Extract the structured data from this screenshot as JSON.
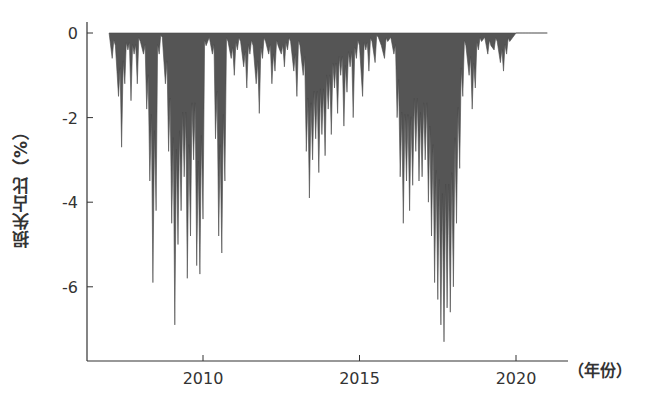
{
  "chart_data": {
    "type": "area",
    "title": "",
    "xlabel": "(年份)",
    "ylabel": "损失占比（%）",
    "x_ticks": [
      2010,
      2015,
      2020
    ],
    "y_ticks": [
      0,
      -2,
      -4,
      -6
    ],
    "xlim": [
      2006.5,
      2021.7
    ],
    "ylim": [
      -7.6,
      0.15
    ],
    "grid": false,
    "legend": null,
    "fill_color": "#555555",
    "x": [
      2007.0,
      2007.1,
      2007.2,
      2007.3,
      2007.4,
      2007.5,
      2007.6,
      2007.7,
      2007.8,
      2007.9,
      2008.0,
      2008.1,
      2008.2,
      2008.3,
      2008.4,
      2008.5,
      2008.6,
      2008.7,
      2008.8,
      2008.9,
      2009.0,
      2009.1,
      2009.2,
      2009.3,
      2009.4,
      2009.5,
      2009.6,
      2009.7,
      2009.8,
      2009.9,
      2010.0,
      2010.1,
      2010.2,
      2010.3,
      2010.4,
      2010.5,
      2010.6,
      2010.7,
      2010.8,
      2010.9,
      2011.0,
      2011.1,
      2011.2,
      2011.3,
      2011.4,
      2011.5,
      2011.6,
      2011.7,
      2011.8,
      2011.9,
      2012.0,
      2012.1,
      2012.2,
      2012.3,
      2012.4,
      2012.5,
      2012.6,
      2012.7,
      2012.8,
      2012.9,
      2013.0,
      2013.1,
      2013.2,
      2013.3,
      2013.4,
      2013.5,
      2013.6,
      2013.7,
      2013.8,
      2013.9,
      2014.0,
      2014.1,
      2014.2,
      2014.3,
      2014.4,
      2014.5,
      2014.6,
      2014.7,
      2014.8,
      2014.9,
      2015.0,
      2015.1,
      2015.2,
      2015.3,
      2015.4,
      2015.5,
      2015.6,
      2015.7,
      2015.8,
      2015.9,
      2016.0,
      2016.1,
      2016.2,
      2016.3,
      2016.4,
      2016.5,
      2016.6,
      2016.7,
      2016.8,
      2016.9,
      2017.0,
      2017.1,
      2017.2,
      2017.3,
      2017.4,
      2017.5,
      2017.6,
      2017.7,
      2017.8,
      2017.9,
      2018.0,
      2018.1,
      2018.2,
      2018.3,
      2018.4,
      2018.5,
      2018.6,
      2018.7,
      2018.8,
      2018.9,
      2019.0,
      2019.1,
      2019.2,
      2019.3,
      2019.4,
      2019.5,
      2019.6,
      2019.7,
      2019.8,
      2019.9,
      2020.0,
      2020.1,
      2020.2,
      2020.3,
      2020.4,
      2020.5,
      2020.6,
      2020.7,
      2020.8,
      2020.9,
      2021.0
    ],
    "values": [
      0,
      -0.6,
      -0.3,
      -1.5,
      -2.7,
      -1.2,
      -0.4,
      -1.6,
      -0.5,
      -1.2,
      -0.2,
      -0.5,
      -1.8,
      -3.5,
      -5.9,
      -4.2,
      -0.5,
      -0.1,
      -1.2,
      -2.8,
      -4.5,
      -6.9,
      -5.0,
      -4.2,
      -3.4,
      -5.8,
      -4.8,
      -3.0,
      -5.5,
      -5.7,
      -4.4,
      -0.3,
      -0.1,
      -0.5,
      -2.5,
      -4.8,
      -5.2,
      -3.5,
      -0.2,
      -0.6,
      -1.0,
      -0.4,
      -0.2,
      -0.8,
      -1.3,
      -0.5,
      -0.3,
      -1.2,
      -1.9,
      -0.6,
      -0.2,
      -0.5,
      -1.2,
      -0.9,
      -0.3,
      -0.5,
      -0.8,
      -0.4,
      -0.2,
      -0.9,
      -1.5,
      -0.3,
      -1.0,
      -2.8,
      -3.9,
      -3.0,
      -2.5,
      -3.3,
      -2.4,
      -2.9,
      -1.8,
      -2.4,
      -1.3,
      -1.9,
      -1.0,
      -2.2,
      -1.4,
      -0.8,
      -2.0,
      -0.6,
      -0.3,
      -1.5,
      -0.4,
      -0.9,
      -0.2,
      -0.7,
      -0.1,
      -0.3,
      -0.6,
      -0.2,
      -0.1,
      -0.5,
      -2.0,
      -3.4,
      -4.5,
      -3.5,
      -4.2,
      -3.6,
      -2.8,
      -3.5,
      -3.4,
      -3.0,
      -4.0,
      -4.8,
      -5.9,
      -6.3,
      -6.9,
      -7.3,
      -6.5,
      -6.6,
      -6.0,
      -4.5,
      -3.2,
      -1.5,
      -0.3,
      -1.0,
      -1.8,
      -1.3,
      -0.4,
      -0.2,
      -0.1,
      -0.5,
      -0.3,
      -0.4,
      -0.2,
      -0.7,
      -0.9,
      -0.5,
      -0.2,
      -0.1,
      0,
      0,
      0,
      0,
      0,
      0,
      0,
      0,
      0,
      0,
      0
    ]
  },
  "axes": {
    "y_label": "损失占比（%）",
    "x_unit_label": "（年份）",
    "y_tick_labels": [
      "0",
      "-2",
      "-4",
      "-6"
    ],
    "x_tick_labels": [
      "2010",
      "2015",
      "2020"
    ]
  }
}
